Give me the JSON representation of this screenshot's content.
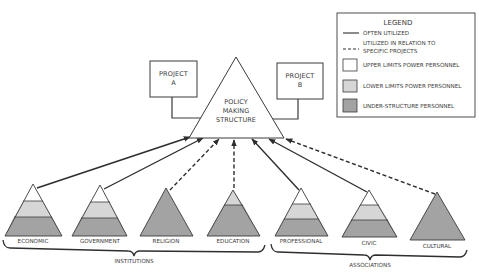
{
  "colors": {
    "upper": "#ffffff",
    "lower": "#d6d6d6",
    "under": "#a3a3a3",
    "stroke": "#3a3a3a",
    "text": "#3a3a3a"
  },
  "legend": {
    "title": "LEGEND",
    "items": [
      {
        "type": "solid-line",
        "label": "OFTEN UTILIZED"
      },
      {
        "type": "dashed-line",
        "label_line1": "UTILIZED IN RELATION TO",
        "label_line2": "SPECIFIC PROJECTS"
      },
      {
        "type": "swatch",
        "swatch": "upper",
        "label": "UPPER LIMITS POWER PERSONNEL"
      },
      {
        "type": "swatch",
        "swatch": "lower",
        "label": "LOWER LIMITS POWER PERSONNEL"
      },
      {
        "type": "swatch",
        "swatch": "under",
        "label": "UNDER-STRUCTURE PERSONNEL"
      }
    ]
  },
  "center": {
    "line1": "POLICY",
    "line2": "MAKING",
    "line3": "STRUCTURE"
  },
  "projects": [
    {
      "line1": "PROJECT",
      "line2": "A"
    },
    {
      "line1": "PROJECT",
      "line2": "B"
    }
  ],
  "pyramids": [
    {
      "label": "ECONOMIC",
      "layers": [
        "upper",
        "lower",
        "under"
      ],
      "link": "often"
    },
    {
      "label": "GOVERNMENT",
      "layers": [
        "upper",
        "lower",
        "under"
      ],
      "link": "often"
    },
    {
      "label": "RELIGION",
      "layers": [
        "under"
      ],
      "link": "specific"
    },
    {
      "label": "EDUCATION",
      "layers": [
        "lower",
        "under"
      ],
      "link": "specific"
    },
    {
      "label": "PROFESSIONAL",
      "layers": [
        "upper",
        "lower",
        "under"
      ],
      "link": "often"
    },
    {
      "label": "CIVIC",
      "layers": [
        "upper",
        "lower",
        "under"
      ],
      "link": "often"
    },
    {
      "label": "CULTURAL",
      "layers": [
        "under"
      ],
      "link": "specific"
    }
  ],
  "groups": [
    {
      "label": "INSTITUTIONS"
    },
    {
      "label": "ASSOCIATIONS"
    }
  ]
}
